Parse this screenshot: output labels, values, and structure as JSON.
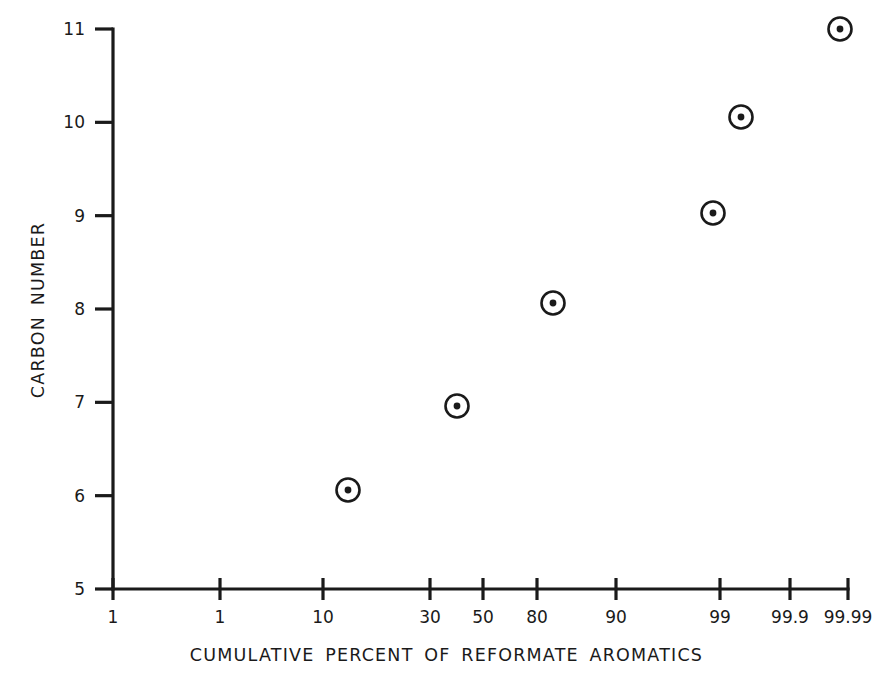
{
  "chart_data": {
    "type": "scatter",
    "title": "",
    "xlabel": "CUMULATIVE PERCENT OF REFORMATE AROMATICS",
    "ylabel": "CARBON NUMBER",
    "grid": false,
    "legend": null,
    "x_scale": "probability",
    "y_scale": "linear",
    "ylim": [
      5,
      11
    ],
    "x_tick_labels": [
      "1",
      "1",
      "10",
      "30",
      "50",
      "80",
      "90",
      "99",
      "99.9",
      "99.99"
    ],
    "x_tick_pixels": [
      113,
      220,
      323,
      430,
      483,
      537,
      616,
      720,
      790,
      848
    ],
    "y_tick_labels": [
      "5",
      "6",
      "7",
      "8",
      "9",
      "10",
      "11"
    ],
    "y_tick_values": [
      5,
      6,
      7,
      8,
      9,
      10,
      11
    ],
    "series": [
      {
        "name": "Reformate aromatics",
        "marker": "circle-with-center-dot",
        "points": [
          {
            "label": "C6",
            "carbon_number": 6,
            "cumulative_percent": 9.7,
            "px": 348,
            "py": 490
          },
          {
            "label": "C7",
            "carbon_number": 7,
            "cumulative_percent": 40,
            "px": 457,
            "py": 406
          },
          {
            "label": "C8",
            "carbon_number": 8.05,
            "cumulative_percent": 82,
            "px": 553,
            "py": 303
          },
          {
            "label": "C9",
            "carbon_number": 9,
            "cumulative_percent": 99,
            "px": 713,
            "py": 213
          },
          {
            "label": "C10",
            "carbon_number": 10.05,
            "cumulative_percent": 99.5,
            "px": 741,
            "py": 117
          },
          {
            "label": "C11",
            "carbon_number": 11,
            "cumulative_percent": 99.95,
            "px": 840,
            "py": 29
          }
        ]
      }
    ]
  },
  "axes": {
    "origin_px": {
      "x": 113,
      "y": 589
    },
    "x_end_px": 848,
    "y_top_px": 29
  },
  "colors": {
    "line": "#1a1a1a",
    "marker": "#1a1a1a",
    "background": "#ffffff"
  }
}
